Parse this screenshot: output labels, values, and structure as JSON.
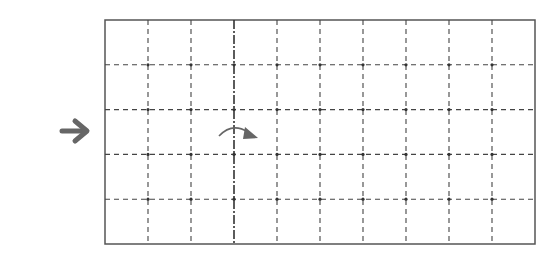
{
  "diagram": {
    "type": "folding-grid",
    "grid": {
      "columns": 10,
      "rows": 5,
      "x": 105,
      "y": 20,
      "width": 430,
      "height": 224,
      "line_style": "dashed",
      "fold_line_column_index": 3,
      "fold_line_style": "dash-dot-heavy"
    },
    "indicators": {
      "direction_arrow": "right-arrow",
      "fold_arrow": "curved-arrow-right"
    },
    "colors": {
      "border": "#555555",
      "grid_line": "#444444",
      "arrow": "#666666"
    }
  }
}
